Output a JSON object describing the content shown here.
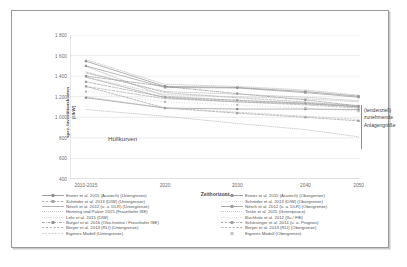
{
  "chart_data": {
    "type": "line",
    "title": "",
    "xlabel": "Zeithorizont",
    "ylabel": "spez. Investitionskosten [€/kW]",
    "ylim": [
      400,
      1800
    ],
    "yticks": [
      "1 800",
      "1 600",
      "1 400",
      "1 200",
      "1 000",
      "800",
      "600",
      "400"
    ],
    "ytick_values": [
      1800,
      1600,
      1400,
      1200,
      1000,
      800,
      600,
      400
    ],
    "grid": true,
    "grid_axis": "y",
    "legend_position": "bottom",
    "categories": [
      "2010-2015",
      "2020",
      "2030",
      "2040",
      "2050"
    ],
    "x": [
      2012.5,
      2020,
      2030,
      2040,
      2050
    ],
    "annotations": [
      {
        "text": "Hüllkurven",
        "x": 2018,
        "y": 900
      },
      {
        "text": "(tendenziell) zunehmende Anlagengröße",
        "x": 2051,
        "y": 1050
      }
    ],
    "series": [
      {
        "name": "Eisner et al. 2015 (Acatech) (Untergrenze)",
        "style": "solid-marker",
        "color": "#8a8a8a",
        "values": [
          1190,
          1090,
          1080,
          1080,
          1075
        ]
      },
      {
        "name": "Schröder et al. 2013 (DIW) (Untergrenze)",
        "style": "dash-marker",
        "color": "#9a9a9a",
        "values": [
          1300,
          1090,
          1040,
          1000,
          965
        ]
      },
      {
        "name": "Nitsch et al. 2012 (u. a. DLR) (Untergrenze)",
        "style": "solid",
        "color": "#a0a0a0",
        "values": [
          1390,
          1190,
          1150,
          1130,
          1105
        ]
      },
      {
        "name": "Henning und Palzer 2015 (Fraunhofer ISE)",
        "style": "dotted",
        "color": "#b0b0b0",
        "values": [
          1495,
          1205,
          1165,
          1140,
          1115
        ]
      },
      {
        "name": "Lehr et al. 2015 (DIW)",
        "style": "fine-dot",
        "color": "#b4b4b4",
        "values": [
          1075,
          1010,
          940,
          880,
          810
        ]
      },
      {
        "name": "Burger et al. 2016 (Öko-Institut / Fraunhofer ISE)",
        "style": "dashdot-marker",
        "color": "#8f8f8f",
        "values": [
          1400,
          1300,
          1230,
          1170,
          1110
        ]
      },
      {
        "name": "Breyer et al. 2013 (RLI) (Untergrenze)",
        "style": "dash",
        "color": "#a8a8a8",
        "values": [
          1440,
          1240,
          1190,
          1150,
          1100
        ]
      },
      {
        "name": "Eigenes Modell (Untergrenze)",
        "style": "none",
        "color": "#bdbdbd",
        "values": [
          1200,
          1090,
          1050,
          1010,
          980
        ]
      },
      {
        "name": "Eisner et al. 2015 (Acatech) (Obergrenze)",
        "style": "solid-marker",
        "color": "#8a8a8a",
        "values": [
          1545,
          1300,
          1290,
          1250,
          1205
        ]
      },
      {
        "name": "Schröder et al. 2013 (DIW) (Obergrenze)",
        "style": "fine-dot",
        "color": "#b0b0b0",
        "values": [
          1560,
          1320,
          1300,
          1265,
          1215
        ]
      },
      {
        "name": "Nitsch et al. 2012 (u. a. DLR) (Obergrenze)",
        "style": "solid-marker",
        "color": "#959595",
        "values": [
          1500,
          1290,
          1285,
          1240,
          1195
        ]
      },
      {
        "name": "Teske et al. 2015 (Greenpeace)",
        "style": "dotted",
        "color": "#b4b4b4",
        "values": [
          1430,
          1250,
          1225,
          1195,
          1160
        ]
      },
      {
        "name": "Buchholz et al. 2012 (IIu / FfE)",
        "style": "fine-dot",
        "color": "#bbbbbb",
        "values": [
          1390,
          1220,
          1200,
          1180,
          1150
        ]
      },
      {
        "name": "Schlesinger et al. 2014 (u. a. Prognos)",
        "style": "dash-marker",
        "color": "#9a9a9a",
        "values": [
          1345,
          1195,
          1165,
          1135,
          1100
        ]
      },
      {
        "name": "Breyer et al. 2013 (RLI) (Obergrenze)",
        "style": "dash",
        "color": "#a8a8a8",
        "values": [
          1300,
          1180,
          1150,
          1120,
          1090
        ]
      },
      {
        "name": "Eigenes Modell (Obergrenze)",
        "style": "marker-only",
        "color": "#bdbdbd",
        "values": [
          1250,
          1150,
          1120,
          1090,
          1060
        ]
      }
    ]
  },
  "axes": {
    "ylabel_line1": "spez. Investitionskosten",
    "ylabel_line2": "[€/kW]",
    "xlabel": "Zeithorizont"
  },
  "plot_annotations": {
    "huellkurven": "Hüllkurven",
    "anlagengroesse": "(tendenziell) zunehmende Anlagengröße"
  },
  "legend": {
    "left_column": [
      "Eisner et al. 2015 (Acatech) (Untergrenze)",
      "Schröder et al. 2013 (DIW) (Untergrenze)",
      "Nitsch et al. 2012 (u. a. DLR) (Untergrenze)",
      "Henning und Palzer 2015 (Fraunhofer ISE)",
      "Lehr et al. 2015 (DIW)",
      "Burger et al. 2016 (Öko-Institut / Fraunhofer ISE)",
      "Breyer et al. 2013 (RLI) (Untergrenze)",
      "Eigenes Modell (Untergrenze)"
    ],
    "right_column": [
      "Eisner et al. 2015 (Acatech) (Obergrenze)",
      "Schröder et al. 2013 (DIW) (Obergrenze)",
      "Nitsch et al. 2012 (u. a. DLR) (Obergrenze)",
      "Teske et al. 2015 (Greenpeace)",
      "Buchholz et al. 2012 (IIu / FfE)",
      "Schlesinger et al. 2014 (u. a. Prognos)",
      "Breyer et al. 2013 (RLI) (Obergrenze)",
      "Eigenes Modell (Obergrenze)"
    ]
  },
  "colors": {
    "frame": "#9a9a9a",
    "grid": "#dcdcdc",
    "text": "#6d6d6d",
    "line": "#9a9a9a"
  }
}
